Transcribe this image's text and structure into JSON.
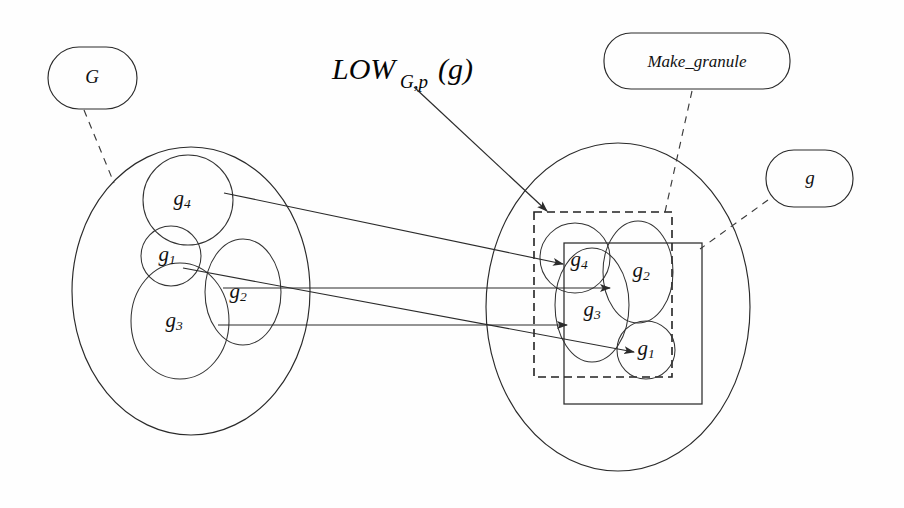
{
  "figure": {
    "background_color": "#fefefe",
    "stroke_color": "#2a2a2a"
  },
  "labels": {
    "source_set": "G",
    "operator_main": "LOW",
    "operator_subscript": "G,p",
    "operator_argument": "(g)",
    "operator_full": "LOW_{G,p}(g)",
    "function_box": "Make_granule",
    "target_set": "g"
  },
  "left_universe": {
    "name": "G",
    "granules": [
      {
        "id": "g4",
        "label": "g",
        "sub": "4"
      },
      {
        "id": "g1",
        "label": "g",
        "sub": "1"
      },
      {
        "id": "g2",
        "label": "g",
        "sub": "2"
      },
      {
        "id": "g3",
        "label": "g",
        "sub": "3"
      }
    ]
  },
  "right_universe": {
    "name": "g",
    "granules": [
      {
        "id": "g4",
        "label": "g",
        "sub": "4"
      },
      {
        "id": "g2",
        "label": "g",
        "sub": "2"
      },
      {
        "id": "g3",
        "label": "g",
        "sub": "3"
      },
      {
        "id": "g1",
        "label": "g",
        "sub": "1"
      }
    ],
    "dashed_region": "LOW_{G,p}(g)",
    "solid_region": "g"
  },
  "mappings": [
    {
      "from": "g4",
      "to": "g4"
    },
    {
      "from": "g1",
      "to": "g1"
    },
    {
      "from": "g2",
      "to": "g2"
    },
    {
      "from": "g3",
      "to": "g3"
    }
  ]
}
